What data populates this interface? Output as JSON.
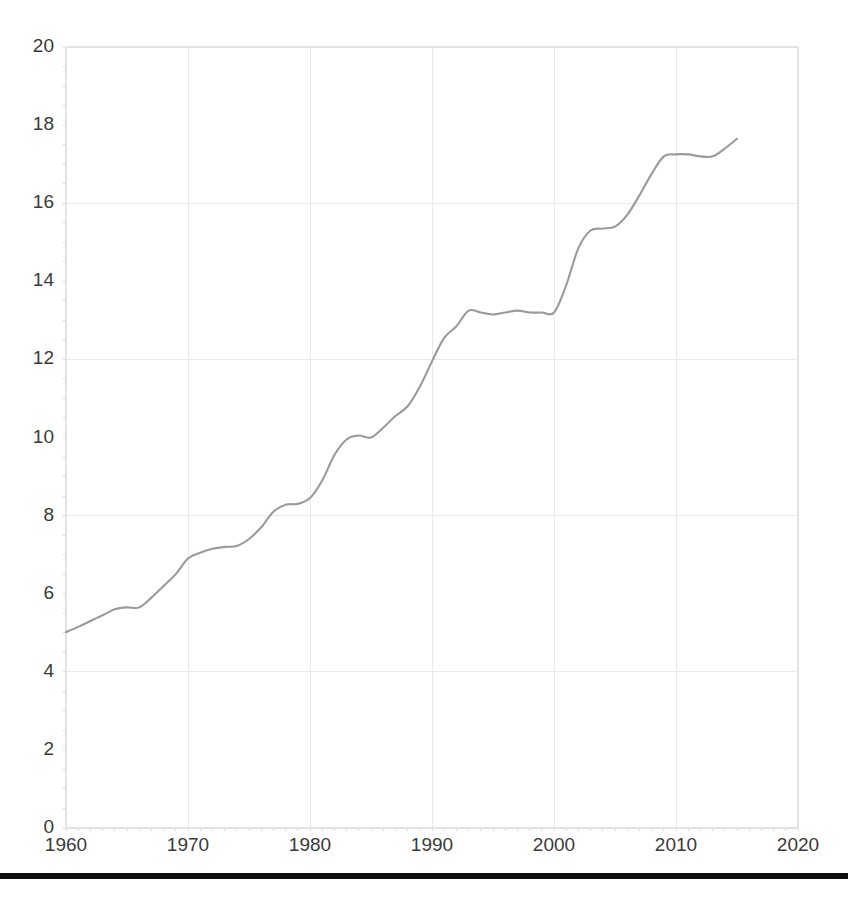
{
  "chart_data": {
    "type": "line",
    "title": "",
    "subtitle": "",
    "xlabel": "",
    "ylabel": "",
    "xlim": [
      1960,
      2020
    ],
    "ylim": [
      0,
      20
    ],
    "grid": true,
    "legend": null,
    "legend_position": "none",
    "line_color": "#9a9a9a",
    "xticks": [
      1960,
      1970,
      1980,
      1990,
      2000,
      2010,
      2020
    ],
    "xtick_labels": [
      "1960",
      "1970",
      "1980",
      "1990",
      "2000",
      "2010",
      "2020"
    ],
    "yticks": [
      0,
      2,
      4,
      6,
      8,
      10,
      12,
      14,
      16,
      18,
      20
    ],
    "ytick_labels": [
      "0",
      "2",
      "4",
      "6",
      "8",
      "10",
      "12",
      "14",
      "16",
      "18",
      "20"
    ],
    "x": [
      1960,
      1961,
      1962,
      1963,
      1964,
      1965,
      1966,
      1967,
      1968,
      1969,
      1970,
      1971,
      1972,
      1973,
      1974,
      1975,
      1976,
      1977,
      1978,
      1979,
      1980,
      1981,
      1982,
      1983,
      1984,
      1985,
      1986,
      1987,
      1988,
      1989,
      1990,
      1991,
      1992,
      1993,
      1994,
      1995,
      1996,
      1997,
      1998,
      1999,
      2000,
      2001,
      2002,
      2003,
      2004,
      2005,
      2006,
      2007,
      2008,
      2009,
      2010,
      2011,
      2012,
      2013,
      2014,
      2015
    ],
    "values": [
      5.02,
      5.15,
      5.3,
      5.45,
      5.6,
      5.65,
      5.65,
      5.9,
      6.2,
      6.5,
      6.9,
      7.05,
      7.15,
      7.2,
      7.22,
      7.4,
      7.7,
      8.1,
      8.28,
      8.3,
      8.45,
      8.9,
      9.55,
      9.95,
      10.05,
      10.0,
      10.25,
      10.55,
      10.8,
      11.3,
      11.95,
      12.55,
      12.85,
      13.25,
      13.2,
      13.15,
      13.2,
      13.25,
      13.2,
      13.2,
      13.2,
      13.9,
      14.85,
      15.3,
      15.35,
      15.4,
      15.7,
      16.2,
      16.75,
      17.2,
      17.25,
      17.25,
      17.2,
      17.2,
      17.4,
      17.65
    ]
  }
}
